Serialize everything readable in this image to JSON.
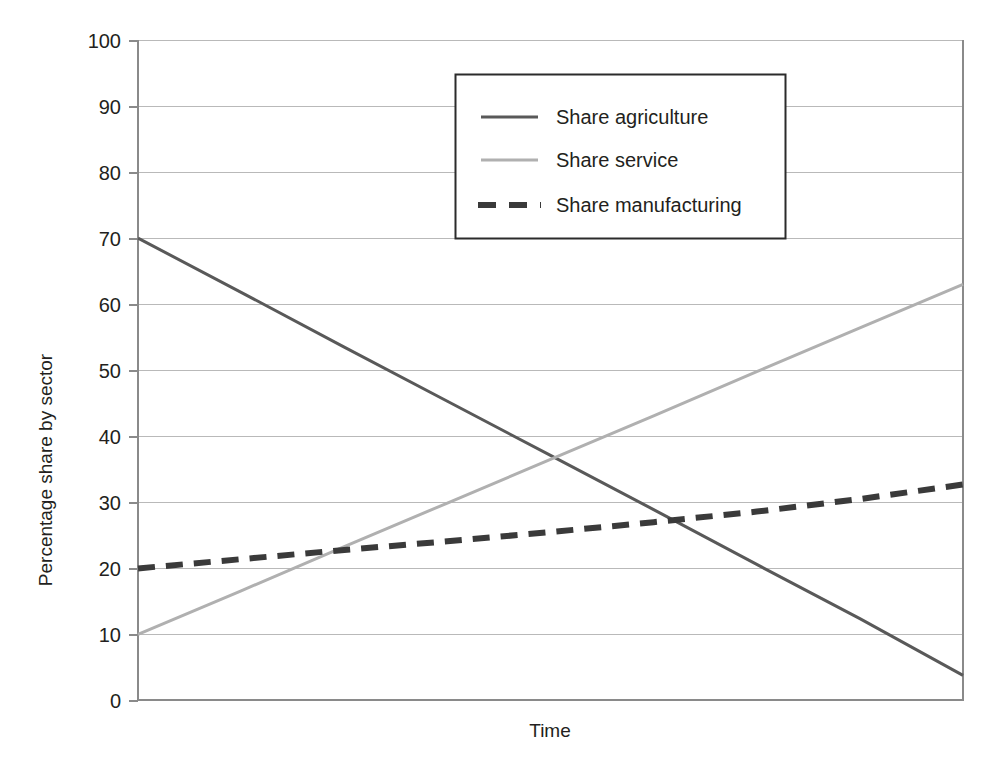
{
  "chart_data": {
    "type": "line",
    "title": "",
    "xlabel": "Time",
    "ylabel": "Percentage share by sector",
    "xlim": [
      0,
      100
    ],
    "ylim": [
      0,
      100
    ],
    "grid": true,
    "x_tick_labels": [],
    "y_tick_labels": [
      "0",
      "10",
      "20",
      "30",
      "40",
      "50",
      "60",
      "70",
      "80",
      "90",
      "100"
    ],
    "y_ticks": [
      0,
      10,
      20,
      30,
      40,
      50,
      60,
      70,
      80,
      90,
      100
    ],
    "legend_position": "top-center-right",
    "series": [
      {
        "name": "Share agriculture",
        "style": "solid",
        "color": "#595959",
        "width": 3,
        "x": [
          0,
          12.5,
          25,
          37.5,
          50,
          62.5,
          75,
          87.5,
          100
        ],
        "values": [
          70,
          61.8,
          53.5,
          45.3,
          37.1,
          28.9,
          20.6,
          12.4,
          3.8
        ]
      },
      {
        "name": "Share service",
        "style": "solid",
        "color": "#b0b0b0",
        "width": 3,
        "x": [
          0,
          12.5,
          25,
          37.5,
          50,
          62.5,
          75,
          87.5,
          100
        ],
        "values": [
          10,
          16.6,
          23.3,
          29.9,
          36.5,
          43.1,
          49.8,
          56.4,
          63
        ]
      },
      {
        "name": "Share manufacturing",
        "style": "dashed",
        "color": "#3a3a3a",
        "width": 5,
        "x": [
          0,
          12.5,
          25,
          37.5,
          50,
          62.5,
          75,
          87.5,
          100
        ],
        "values": [
          20,
          21.4,
          22.8,
          24.1,
          25.5,
          27.0,
          28.6,
          30.5,
          32.7
        ]
      }
    ]
  },
  "axes": {
    "y_title": "Percentage share by sector",
    "x_title": "Time"
  },
  "ticks": {
    "y": [
      "100",
      "90",
      "80",
      "70",
      "60",
      "50",
      "40",
      "30",
      "20",
      "10",
      "0"
    ]
  },
  "legend": {
    "items": [
      {
        "label": "Share agriculture",
        "swatch": "line-solid-dark-swatch"
      },
      {
        "label": "Share service",
        "swatch": "line-solid-light-swatch"
      },
      {
        "label": "Share manufacturing",
        "swatch": "line-dashed-dark-swatch"
      }
    ]
  },
  "colors": {
    "agriculture": "#595959",
    "service": "#b0b0b0",
    "manufacturing": "#3a3a3a",
    "grid": "#b9b9b9",
    "axis": "#8a8a8a",
    "text": "#231f20"
  },
  "caption": {
    "text": ""
  }
}
